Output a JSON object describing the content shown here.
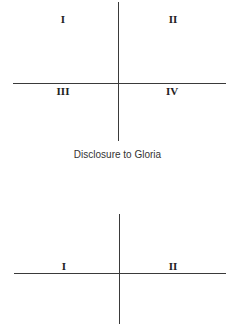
{
  "figures": [
    {
      "quadrants": {
        "top_left": "I",
        "top_right": "II",
        "bottom_left": "III",
        "bottom_right": "IV"
      },
      "caption": "Disclosure to Gloria"
    },
    {
      "quadrants": {
        "top_left": "I",
        "top_right": "II"
      }
    }
  ],
  "colors": {
    "line": "#3a3a3a",
    "label": "#222222",
    "caption": "#333333",
    "background": "#ffffff"
  }
}
